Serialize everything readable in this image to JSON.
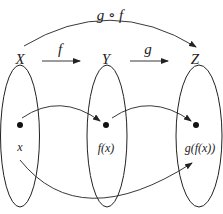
{
  "diagram": {
    "type": "function-composition",
    "sets": [
      {
        "id": "X",
        "label": "X",
        "element": "x"
      },
      {
        "id": "Y",
        "label": "Y",
        "element": "f(x)"
      },
      {
        "id": "Z",
        "label": "Z",
        "element": "g(f(x))"
      }
    ],
    "arrows": [
      {
        "from": "X",
        "to": "Y",
        "label": "f"
      },
      {
        "from": "Y",
        "to": "Z",
        "label": "g"
      },
      {
        "from": "X",
        "to": "Z",
        "label": "g ∘ f"
      }
    ],
    "colors": {
      "stroke": "#222222",
      "background": "#ffffff"
    }
  }
}
